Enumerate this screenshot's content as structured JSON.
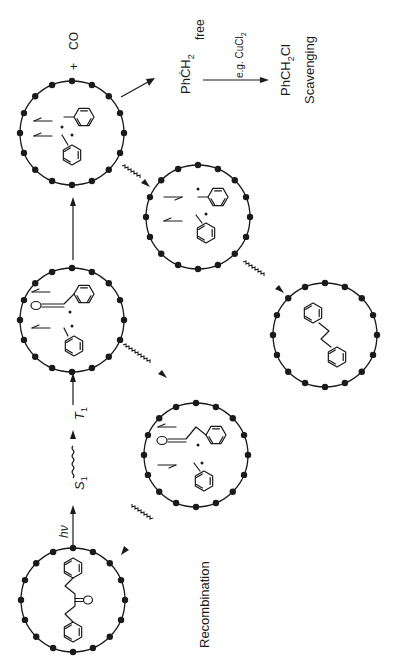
{
  "figure": {
    "orientation": "rotated-90-ccw",
    "colors": {
      "ink": "#1a1a1a",
      "background": "#ffffff"
    }
  },
  "labels": {
    "excitation": "hν",
    "singlet": "S",
    "singlet_sub": "1",
    "triplet": "T",
    "triplet_sub": "1",
    "plus": "+",
    "co": "CO",
    "free_radical": "PhĊH",
    "free_radical_sub": "2",
    "free": "free",
    "scavenger": "e.g. CuCl",
    "scavenger_sub": "2",
    "product": "PhCH",
    "product_sub": "2",
    "product_tail": "Cl",
    "scavenging": "Scavenging",
    "recombination": "Recombination"
  },
  "cages": [
    {
      "id": "dibenzyl-ketone",
      "contents": "PhCH2C(O)CH2Ph"
    },
    {
      "id": "acyl-benzyl-pair-1",
      "contents": "PhCH2C•O + •CH2Ph (spins)"
    },
    {
      "id": "benzyl-pair-1",
      "contents": "2 •CH2Ph (spins)"
    },
    {
      "id": "benzyl-pair-2",
      "contents": "2 •CH2Ph (spins)"
    },
    {
      "id": "acyl-benzyl-pair-2",
      "contents": "PhCH2C•O + •CH2Ph (spins)"
    },
    {
      "id": "bibenzyl",
      "contents": "PhCH2CH2Ph"
    }
  ]
}
